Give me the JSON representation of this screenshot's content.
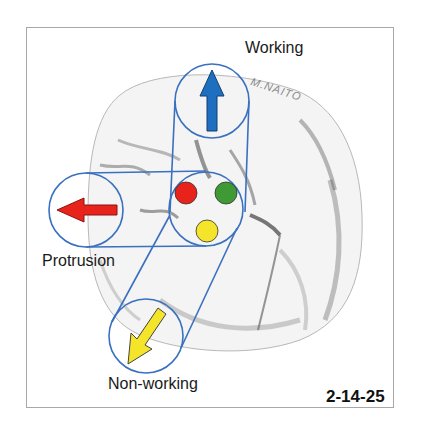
{
  "figure": {
    "id_label": "2-14-25",
    "signature": "M.NAITO"
  },
  "labels": {
    "working": "Working",
    "protrusion": "Protrusion",
    "non_working": "Non-working"
  },
  "contacts": [
    {
      "color_name": "red",
      "color": "#e8231c"
    },
    {
      "color_name": "green",
      "color": "#3f9a35"
    },
    {
      "color_name": "yellow",
      "color": "#f5e52a"
    }
  ],
  "arrows": [
    {
      "direction": "up",
      "movement": "Working",
      "color": "#1f6fc0"
    },
    {
      "direction": "left",
      "movement": "Protrusion",
      "color": "#e8231c"
    },
    {
      "direction": "down-left",
      "movement": "Non-working",
      "color": "#f5e52a"
    }
  ],
  "colors": {
    "outline_blue": "#3a70c0",
    "frame_border": "#a8a8a8"
  }
}
